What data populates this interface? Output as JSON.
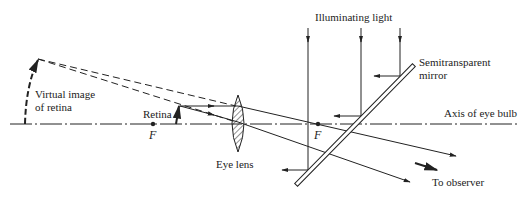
{
  "labels": {
    "illuminating_light": "Illuminating light",
    "semitransparent_line1": "Semitransparent",
    "semitransparent_line2": "mirror",
    "axis": "Axis of eye bulb",
    "virtual_line1": "Virtual image",
    "virtual_line2": "of retina",
    "retina": "Retina",
    "focal_left": "F",
    "focal_right": "F",
    "eye_lens": "Eye lens",
    "to_observer": "To observer"
  },
  "colors": {
    "ink": "#222222"
  }
}
